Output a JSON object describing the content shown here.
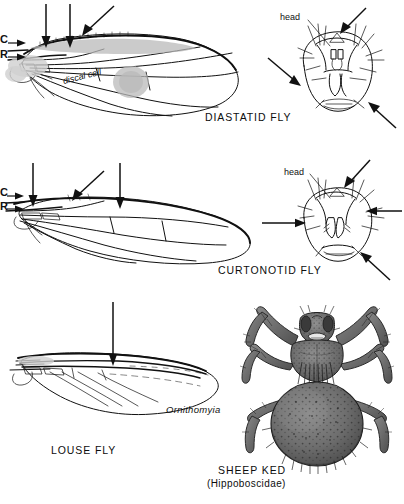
{
  "plate": {
    "title_visible": false,
    "background": "#ffffff",
    "ink": "#111111"
  },
  "figures": [
    {
      "id": "diastatid-wing",
      "caption": "DIASTATID FLY",
      "kind": "wing-venation-line-art",
      "labels": [
        {
          "name": "costa",
          "text": "C"
        },
        {
          "name": "radius",
          "text": "R"
        },
        {
          "name": "discal-cell",
          "text": "discal cell"
        }
      ],
      "arrow_count": 3,
      "notes_visible": false
    },
    {
      "id": "diastatid-head",
      "caption": "",
      "kind": "head-frontal-line-art",
      "labels": [
        {
          "name": "head",
          "text": "head"
        }
      ],
      "arrow_count": 3
    },
    {
      "id": "curtonotid-wing",
      "caption": "CURTONOTID FLY",
      "kind": "wing-venation-line-art",
      "labels": [
        {
          "name": "costa",
          "text": "C"
        },
        {
          "name": "radius",
          "text": "R"
        }
      ],
      "arrow_count": 3
    },
    {
      "id": "curtonotid-head",
      "caption": "",
      "kind": "head-frontal-line-art",
      "labels": [
        {
          "name": "head",
          "text": "head"
        }
      ],
      "arrow_count": 3
    },
    {
      "id": "louse-fly-wing",
      "caption": "LOUSE FLY",
      "kind": "wing-venation-line-art",
      "labels": [
        {
          "name": "genus",
          "text": "Ornithomyia"
        }
      ],
      "arrow_count": 1
    },
    {
      "id": "sheep-ked",
      "caption": "SHEEP KED",
      "caption_sub": "(Hippoboscidae)",
      "kind": "halftone-engraving-dorsal-habitus"
    }
  ],
  "captions": {
    "diastatid": "DIASTATID FLY",
    "curtonotid": "CURTONOTID FLY",
    "louse_fly": "LOUSE FLY",
    "sheep_ked": "SHEEP KED",
    "sheep_ked_family": "(Hippoboscidae)"
  },
  "labels": {
    "head_1": "head",
    "head_2": "head",
    "costa_1": "C",
    "radius_1": "R",
    "costa_2": "C",
    "radius_2": "R",
    "discal_cell": "discal cell",
    "ornithomyia": "Ornithomyia"
  }
}
